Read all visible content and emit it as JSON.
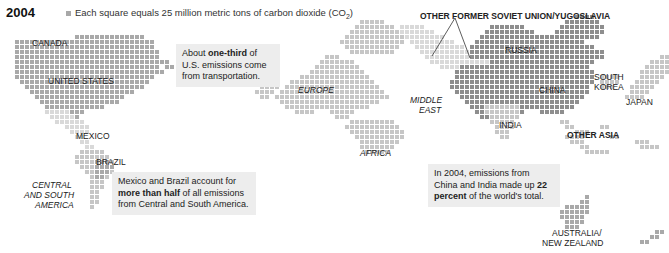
{
  "header": {
    "year": "2004",
    "legend_text": "Each square equals 25 million metric tons of carbon dioxide (CO",
    "legend_sub": "2",
    "legend_close": ")"
  },
  "colors": {
    "dark": "#8e8e8e",
    "medium": "#a9a9a9",
    "light": "#c6c6c6",
    "pale": "#d9d9d9"
  },
  "labels": [
    {
      "id": "canada",
      "text": "CANADA",
      "x": 32,
      "y": 38,
      "style": ""
    },
    {
      "id": "united-states",
      "text": "UNITED STATES",
      "x": 48,
      "y": 76,
      "style": ""
    },
    {
      "id": "mexico",
      "text": "MEXICO",
      "x": 76,
      "y": 131,
      "style": ""
    },
    {
      "id": "brazil",
      "text": "BRAZIL",
      "x": 96,
      "y": 157,
      "style": ""
    },
    {
      "id": "central-south-america",
      "text": "CENTRAL",
      "x": 32,
      "y": 180,
      "style": "ital"
    },
    {
      "id": "central-south-america-2",
      "text": "AND SOUTH",
      "x": 24,
      "y": 190,
      "style": "ital"
    },
    {
      "id": "central-south-america-3",
      "text": "AMERICA",
      "x": 35,
      "y": 200,
      "style": "ital"
    },
    {
      "id": "europe",
      "text": "EUROPE",
      "x": 298,
      "y": 85,
      "style": "ital"
    },
    {
      "id": "middle-east",
      "text": "MIDDLE",
      "x": 410,
      "y": 95,
      "style": "ital"
    },
    {
      "id": "middle-east-2",
      "text": "EAST",
      "x": 419,
      "y": 105,
      "style": "ital"
    },
    {
      "id": "africa",
      "text": "AFRICA",
      "x": 360,
      "y": 148,
      "style": "ital"
    },
    {
      "id": "other-fsu",
      "text": "OTHER FORMER SOVIET UNION/YUGOSLAVIA",
      "x": 420,
      "y": 11,
      "style": "bold"
    },
    {
      "id": "russia",
      "text": "RUSSIA",
      "x": 505,
      "y": 45,
      "style": ""
    },
    {
      "id": "china",
      "text": "CHINA",
      "x": 539,
      "y": 85,
      "style": ""
    },
    {
      "id": "south-korea",
      "text": "SOUTH",
      "x": 594,
      "y": 72,
      "style": ""
    },
    {
      "id": "south-korea-2",
      "text": "KOREA",
      "x": 594,
      "y": 82,
      "style": ""
    },
    {
      "id": "japan",
      "text": "JAPAN",
      "x": 626,
      "y": 97,
      "style": ""
    },
    {
      "id": "india",
      "text": "INDIA",
      "x": 499,
      "y": 120,
      "style": ""
    },
    {
      "id": "other-asia",
      "text": "OTHER ASIA",
      "x": 567,
      "y": 130,
      "style": "bold"
    },
    {
      "id": "australia",
      "text": "AUSTRALIA/",
      "x": 552,
      "y": 228,
      "style": ""
    },
    {
      "id": "australia-2",
      "text": "NEW ZEALAND",
      "x": 542,
      "y": 238,
      "style": ""
    }
  ],
  "notes": [
    {
      "id": "us-transport",
      "x": 176,
      "y": 44,
      "w": 92,
      "pre": "About ",
      "bold": "one-third",
      "post": " of U.S. emissions come from transportation."
    },
    {
      "id": "mex-brazil",
      "x": 112,
      "y": 172,
      "w": 132,
      "pre": "Mexico and Brazil account for ",
      "bold": "more than half",
      "post": " of all emissions from Central and South America."
    },
    {
      "id": "china-india",
      "x": 428,
      "y": 164,
      "w": 120,
      "pre": "In 2004, emissions from China and India made up ",
      "bold": "22 percent",
      "post": " of the world's total."
    }
  ],
  "chart_data": {
    "type": "cartogram",
    "title": "2004",
    "unit": "Each square equals 25 million metric tons of carbon dioxide (CO2)",
    "regions": [
      "Canada",
      "United States",
      "Mexico",
      "Central and South America",
      "Brazil",
      "Europe",
      "Africa",
      "Middle East",
      "Russia",
      "Other Former Soviet Union/Yugoslavia",
      "China",
      "India",
      "South Korea",
      "Japan",
      "Other Asia",
      "Australia/New Zealand"
    ],
    "annotations": [
      "About one-third of U.S. emissions come from transportation.",
      "Mexico and Brazil account for more than half of all emissions from Central and South America.",
      "In 2004, emissions from China and India made up 22 percent of the world's total."
    ],
    "blocks": [
      {
        "region": "Canada",
        "color": "medium",
        "rows": [
          [
            7,
            15,
            28
          ]
        ]
      },
      {
        "region": "United States",
        "color": "medium",
        "rows": [
          [
            8,
            3,
            30
          ],
          [
            9,
            3,
            30
          ],
          [
            10,
            3,
            31
          ],
          [
            11,
            3,
            31
          ],
          [
            12,
            3,
            33
          ],
          [
            13,
            3,
            31
          ],
          [
            14,
            3,
            30
          ],
          [
            15,
            3,
            30
          ],
          [
            16,
            4,
            29
          ],
          [
            17,
            5,
            28
          ],
          [
            18,
            6,
            26
          ],
          [
            19,
            7,
            24
          ],
          [
            20,
            8,
            23
          ],
          [
            21,
            9,
            20
          ]
        ]
      },
      {
        "region": "Alaska/East",
        "color": "medium",
        "rows": [
          [
            13,
            33,
            34
          ],
          [
            14,
            31,
            32
          ]
        ]
      },
      {
        "region": "Mexico",
        "color": "pale",
        "rows": [
          [
            22,
            9,
            13
          ],
          [
            23,
            10,
            14
          ],
          [
            24,
            11,
            16
          ],
          [
            25,
            13,
            17
          ],
          [
            26,
            14,
            17
          ]
        ]
      },
      {
        "region": "Mexico-dark",
        "color": "medium",
        "rows": [
          [
            22,
            14,
            16
          ],
          [
            23,
            15,
            15
          ]
        ]
      },
      {
        "region": "Central America",
        "color": "pale",
        "rows": [
          [
            27,
            15,
            16
          ],
          [
            28,
            16,
            17
          ],
          [
            29,
            17,
            18
          ]
        ]
      },
      {
        "region": "South America",
        "color": "light",
        "rows": [
          [
            30,
            16,
            20
          ],
          [
            31,
            15,
            21
          ],
          [
            32,
            15,
            22
          ],
          [
            33,
            16,
            22
          ],
          [
            34,
            17,
            22
          ],
          [
            35,
            18,
            21
          ],
          [
            36,
            18,
            20
          ],
          [
            37,
            18,
            20
          ],
          [
            38,
            18,
            19
          ],
          [
            39,
            18,
            19
          ],
          [
            40,
            18,
            19
          ],
          [
            41,
            18,
            18
          ]
        ]
      },
      {
        "region": "Brazil",
        "color": "medium",
        "rows": [
          [
            32,
            19,
            21
          ],
          [
            33,
            19,
            22
          ],
          [
            34,
            19,
            21
          ],
          [
            35,
            19,
            20
          ]
        ]
      },
      {
        "region": "Europe",
        "color": "light",
        "rows": [
          [
            11,
            65,
            67
          ],
          [
            12,
            64,
            70
          ],
          [
            13,
            63,
            71
          ],
          [
            14,
            62,
            72
          ],
          [
            15,
            60,
            73
          ],
          [
            16,
            58,
            74
          ],
          [
            17,
            57,
            75
          ],
          [
            18,
            56,
            76
          ],
          [
            19,
            55,
            77
          ],
          [
            20,
            56,
            75
          ],
          [
            21,
            57,
            73
          ],
          [
            22,
            59,
            62
          ],
          [
            22,
            66,
            70
          ],
          [
            23,
            67,
            69
          ]
        ]
      },
      {
        "region": "Europe-north",
        "color": "light",
        "rows": [
          [
            4,
            72,
            76
          ],
          [
            5,
            71,
            78
          ],
          [
            6,
            70,
            79
          ],
          [
            7,
            69,
            80
          ],
          [
            8,
            68,
            80
          ],
          [
            9,
            69,
            79
          ],
          [
            10,
            70,
            78
          ]
        ]
      },
      {
        "region": "Europe-west",
        "color": "light",
        "rows": [
          [
            16,
            53,
            55
          ],
          [
            17,
            52,
            55
          ],
          [
            18,
            51,
            54
          ],
          [
            19,
            52,
            53
          ]
        ]
      },
      {
        "region": "Africa",
        "color": "light",
        "rows": [
          [
            24,
            70,
            78
          ],
          [
            25,
            69,
            79
          ],
          [
            26,
            70,
            80
          ],
          [
            27,
            71,
            80
          ],
          [
            28,
            72,
            79
          ],
          [
            29,
            72,
            78
          ],
          [
            30,
            73,
            77
          ]
        ]
      },
      {
        "region": "Other FSU",
        "color": "pale",
        "rows": [
          [
            5,
            80,
            84
          ],
          [
            6,
            80,
            86
          ],
          [
            7,
            81,
            88
          ],
          [
            8,
            82,
            90
          ],
          [
            9,
            83,
            92
          ],
          [
            10,
            84,
            94
          ],
          [
            11,
            85,
            96
          ],
          [
            12,
            86,
            97
          ],
          [
            13,
            88,
            98
          ]
        ]
      },
      {
        "region": "Middle East",
        "color": "dark",
        "rows": [
          [
            13,
            92,
            99
          ],
          [
            14,
            91,
            100
          ],
          [
            15,
            91,
            101
          ],
          [
            16,
            90,
            102
          ],
          [
            17,
            90,
            103
          ],
          [
            18,
            91,
            104
          ],
          [
            19,
            92,
            104
          ],
          [
            20,
            93,
            105
          ],
          [
            21,
            94,
            106
          ],
          [
            22,
            95,
            104
          ],
          [
            23,
            96,
            102
          ]
        ]
      },
      {
        "region": "Russia",
        "color": "dark",
        "rows": [
          [
            5,
            98,
            104
          ],
          [
            6,
            97,
            106
          ],
          [
            7,
            96,
            112
          ],
          [
            8,
            95,
            116
          ],
          [
            9,
            94,
            118
          ],
          [
            10,
            94,
            120
          ],
          [
            11,
            94,
            120
          ],
          [
            12,
            98,
            118
          ],
          [
            13,
            100,
            117
          ]
        ]
      },
      {
        "region": "Russia-east",
        "color": "dark",
        "rows": [
          [
            3,
            115,
            118
          ],
          [
            4,
            113,
            119
          ],
          [
            5,
            112,
            120
          ],
          [
            6,
            111,
            120
          ],
          [
            7,
            110,
            119
          ]
        ]
      },
      {
        "region": "China",
        "color": "dark",
        "rows": [
          [
            14,
            100,
            118
          ],
          [
            15,
            101,
            118
          ],
          [
            16,
            102,
            118
          ],
          [
            17,
            102,
            117
          ],
          [
            18,
            103,
            117
          ],
          [
            19,
            104,
            116
          ],
          [
            20,
            105,
            115
          ],
          [
            21,
            106,
            114
          ],
          [
            22,
            108,
            112
          ]
        ]
      },
      {
        "region": "India",
        "color": "light",
        "rows": [
          [
            21,
            97,
            103
          ],
          [
            22,
            97,
            103
          ],
          [
            23,
            98,
            103
          ],
          [
            24,
            98,
            102
          ],
          [
            25,
            99,
            102
          ],
          [
            26,
            99,
            101
          ],
          [
            27,
            100,
            101
          ]
        ]
      },
      {
        "region": "South Korea",
        "color": "light",
        "rows": [
          [
            15,
            120,
            123
          ],
          [
            16,
            120,
            123
          ],
          [
            17,
            120,
            122
          ]
        ]
      },
      {
        "region": "Japan",
        "color": "light",
        "rows": [
          [
            10,
            134,
            137
          ],
          [
            11,
            132,
            136
          ],
          [
            12,
            130,
            135
          ],
          [
            13,
            129,
            134
          ],
          [
            14,
            128,
            133
          ],
          [
            15,
            128,
            132
          ],
          [
            16,
            127,
            131
          ],
          [
            17,
            126,
            130
          ],
          [
            18,
            126,
            129
          ],
          [
            19,
            125,
            128
          ]
        ]
      },
      {
        "region": "Other Asia",
        "color": "light",
        "rows": [
          [
            24,
            112,
            113
          ],
          [
            25,
            113,
            114
          ],
          [
            26,
            115,
            117
          ],
          [
            27,
            113,
            116
          ],
          [
            28,
            114,
            116
          ],
          [
            29,
            116,
            117
          ],
          [
            30,
            117,
            121
          ],
          [
            25,
            120,
            121
          ],
          [
            27,
            122,
            123
          ],
          [
            28,
            127,
            129
          ],
          [
            29,
            128,
            131
          ]
        ]
      },
      {
        "region": "Australia",
        "color": "medium",
        "rows": [
          [
            39,
            117,
            117
          ],
          [
            40,
            116,
            117
          ],
          [
            41,
            113,
            117
          ],
          [
            42,
            112,
            117
          ],
          [
            43,
            112,
            116
          ],
          [
            44,
            113,
            116
          ],
          [
            45,
            113,
            115
          ]
        ]
      },
      {
        "region": "New Zealand",
        "color": "medium",
        "rows": [
          [
            46,
            131,
            132
          ],
          [
            47,
            130,
            131
          ],
          [
            48,
            128,
            129
          ]
        ]
      }
    ]
  }
}
